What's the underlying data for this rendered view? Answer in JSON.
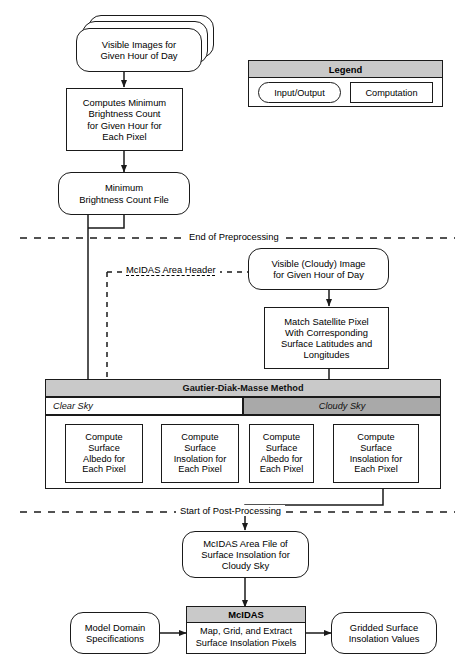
{
  "diagram": {
    "colors": {
      "header_gray": "#c9c9c9",
      "cloudy_gray": "#a9a9a9",
      "clear_white": "#ffffff",
      "stroke": "#1a1a1a"
    }
  },
  "legend": {
    "title": "Legend",
    "items": [
      {
        "label": "Input/Output",
        "shape": "rounded"
      },
      {
        "label": "Computation",
        "shape": "rectangle"
      }
    ]
  },
  "nodes": {
    "visible_images": "Visible Images for\nGiven Hour of Day",
    "computes_min": "Computes Minimum\nBrightness Count\nfor Given Hour for\nEach Pixel",
    "min_file": "Minimum\nBrightness Count File",
    "visible_cloudy": "Visible (Cloudy) Image\nfor Given Hour of Day",
    "match_pixel": "Match Satellite Pixel\nWith Corresponding\nSurface Latitudes and\nLongitudes",
    "clear_albedo": "Compute\nSurface\nAlbedo for\nEach Pixel",
    "clear_insolation": "Compute\nSurface\nInsolation for\nEach Pixel",
    "cloudy_albedo": "Compute\nSurface\nAlbedo for\nEach Pixel",
    "cloudy_insolation": "Compute\nSurface\nInsolation for\nEach Pixel",
    "mcidas_area_file": "McIDAS Area File of\nSurface Insolation for\nCloudy Sky",
    "model_domain": "Model Domain\nSpecifications",
    "mcidas_title": "McIDAS",
    "mcidas_body": "Map, Grid, and Extract\nSurface Insolation Pixels",
    "gridded_values": "Gridded Surface\nInsolation Values"
  },
  "bands": {
    "gautier_title": "Gautier-Diak-Masse Method",
    "clear_sky": "Clear Sky",
    "cloudy_sky": "Cloudy Sky"
  },
  "separators": {
    "end_preprocessing": "End of Preprocessing",
    "mcidas_area_header": "McIDAS Area Header",
    "start_postprocessing": "Start of Post-Processing"
  }
}
